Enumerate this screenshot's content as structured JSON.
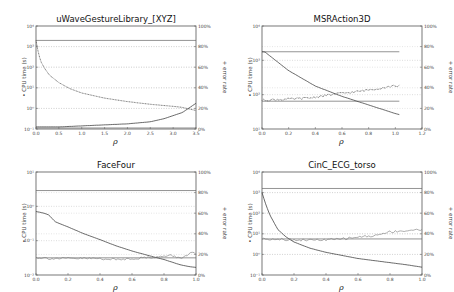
{
  "chart_data": [
    {
      "type": "line",
      "title": "uWaveGestureLibrary_[XYZ]",
      "xlabel": "ρ",
      "ylabel": "CPU time (s)",
      "ylabel_marker": "•",
      "y2label": "error rate",
      "y2label_marker": "+",
      "xlim": [
        0.0,
        3.5
      ],
      "xticks": [
        "0.0",
        "0.5",
        "1.0",
        "1.5",
        "2.0",
        "2.5",
        "3.0",
        "3.5"
      ],
      "ylim_log10": [
        -1,
        4
      ],
      "yticks": [
        "10⁴",
        "10³",
        "10²",
        "10¹",
        "10⁰",
        "10⁻¹"
      ],
      "y2lim": [
        0,
        100
      ],
      "y2ticks": [
        "100%",
        "80%",
        "60%",
        "40%",
        "20%",
        "0%"
      ],
      "grid": "horizontal-dotted",
      "reference_lines": [
        {
          "name": "baseline CPU time",
          "axis": "left",
          "log10_value": 3.3
        },
        {
          "name": "baseline error rate",
          "axis": "right",
          "value": 1
        }
      ],
      "series": [
        {
          "name": "CPU time (s)",
          "axis": "left",
          "style": "dotted",
          "x": [
            0.0,
            0.05,
            0.1,
            0.2,
            0.3,
            0.5,
            0.75,
            1.0,
            1.5,
            2.0,
            2.5,
            3.0,
            3.2,
            3.5
          ],
          "log10_y": [
            3.3,
            2.7,
            2.3,
            1.9,
            1.6,
            1.25,
            0.95,
            0.75,
            0.5,
            0.33,
            0.2,
            0.1,
            0.05,
            -0.1
          ]
        },
        {
          "name": "error rate",
          "axis": "right",
          "style": "solid",
          "x": [
            0.0,
            0.5,
            1.0,
            1.5,
            2.0,
            2.5,
            2.8,
            3.0,
            3.2,
            3.4,
            3.5
          ],
          "y": [
            2,
            2,
            3,
            4,
            5,
            7,
            10,
            13,
            16,
            22,
            25
          ]
        }
      ]
    },
    {
      "type": "line",
      "title": "MSRAction3D",
      "xlabel": "ρ",
      "ylabel": "CPU time (s)",
      "ylabel_marker": "•",
      "y2label": "error rate",
      "y2label_marker": "+",
      "xlim": [
        0.0,
        1.2
      ],
      "xticks": [
        "0.0",
        "0.2",
        "0.4",
        "0.6",
        "0.8",
        "1.0",
        "1.2"
      ],
      "ylim_log10": [
        1,
        4
      ],
      "yticks": [
        "10⁴",
        "10³",
        "10²",
        "10¹"
      ],
      "y2lim": [
        0,
        100
      ],
      "y2ticks": [
        "100%",
        "80%",
        "60%",
        "40%",
        "20%",
        "0%"
      ],
      "grid": "horizontal-dotted",
      "reference_lines": [
        {
          "name": "baseline CPU time",
          "axis": "left",
          "log10_value": 3.25,
          "x_end": 1.03
        },
        {
          "name": "baseline error rate",
          "axis": "right",
          "value": 27,
          "x_end": 1.03
        }
      ],
      "series": [
        {
          "name": "CPU time (s)",
          "axis": "left",
          "style": "solid",
          "x": [
            0.0,
            0.02,
            0.2,
            0.4,
            0.6,
            0.8,
            1.0,
            1.03
          ],
          "log10_y": [
            3.25,
            3.25,
            2.7,
            2.25,
            1.95,
            1.7,
            1.45,
            1.42
          ]
        },
        {
          "name": "error rate",
          "axis": "right",
          "style": "dotted",
          "x": [
            0.0,
            0.2,
            0.35,
            0.45,
            0.55,
            0.7,
            0.85,
            1.0,
            1.03
          ],
          "y": [
            28,
            29,
            30,
            32,
            34,
            36,
            39,
            42,
            42
          ]
        }
      ]
    },
    {
      "type": "line",
      "title": "FaceFour",
      "xlabel": "ρ",
      "ylabel": "CPU time (s)",
      "ylabel_marker": "•",
      "y2label": "error rate",
      "y2label_marker": "+",
      "xlim": [
        0.0,
        1.0
      ],
      "xticks": [
        "0.0",
        "0.2",
        "0.4",
        "0.6",
        "0.8",
        "1.0"
      ],
      "ylim_log10": [
        -2,
        1
      ],
      "yticks": [
        "10¹",
        "10⁰",
        "10⁻¹",
        "10⁻²"
      ],
      "y2lim": [
        0,
        100
      ],
      "y2ticks": [
        "100%",
        "80%",
        "60%",
        "40%",
        "20%",
        "0%"
      ],
      "grid": "horizontal-dotted",
      "reference_lines": [
        {
          "name": "baseline error rate",
          "axis": "right",
          "value": 82
        },
        {
          "name": "baseline CPU time",
          "axis": "left",
          "log10_value": -1.5
        }
      ],
      "series": [
        {
          "name": "CPU time (s)",
          "axis": "left",
          "style": "solid",
          "x": [
            0.0,
            0.05,
            0.08,
            0.12,
            0.2,
            0.3,
            0.4,
            0.5,
            0.6,
            0.7,
            0.8,
            0.9,
            0.95,
            1.0
          ],
          "log10_y": [
            -0.15,
            -0.2,
            -0.25,
            -0.45,
            -0.6,
            -0.8,
            -0.97,
            -1.15,
            -1.3,
            -1.43,
            -1.55,
            -1.7,
            -1.75,
            -1.78
          ]
        },
        {
          "name": "error rate",
          "axis": "right",
          "style": "noisy",
          "x": [
            0.0,
            0.1,
            0.2,
            0.3,
            0.4,
            0.5,
            0.6,
            0.7,
            0.8,
            0.85,
            0.9,
            0.95,
            0.97,
            1.0
          ],
          "y": [
            17,
            16,
            16,
            16,
            16,
            15,
            16,
            17,
            18,
            19,
            16,
            20,
            22,
            20
          ]
        }
      ]
    },
    {
      "type": "line",
      "title": "CinC_ECG_torso",
      "xlabel": "ρ",
      "ylabel": "CPU time (s)",
      "ylabel_marker": "•",
      "y2label": "error rate",
      "y2label_marker": "+",
      "xlim": [
        0.0,
        1.0
      ],
      "xticks": [
        "0.0",
        "0.2",
        "0.4",
        "0.6",
        "0.8",
        "1.0"
      ],
      "ylim_log10": [
        -1,
        4
      ],
      "yticks": [
        "10⁴",
        "10³",
        "10²",
        "10¹",
        "10⁰",
        "10⁻¹"
      ],
      "y2lim": [
        0,
        100
      ],
      "y2ticks": [
        "100%",
        "80%",
        "60%",
        "40%",
        "20%",
        "0%"
      ],
      "grid": "horizontal-dotted",
      "reference_lines": [
        {
          "name": "baseline CPU time",
          "axis": "left",
          "log10_value": 3.2
        },
        {
          "name": "baseline error rate",
          "axis": "right",
          "value": 35
        }
      ],
      "series": [
        {
          "name": "CPU time (s)",
          "axis": "left",
          "style": "solid",
          "x": [
            0.0,
            0.02,
            0.05,
            0.1,
            0.15,
            0.2,
            0.3,
            0.4,
            0.5,
            0.6,
            0.7,
            0.8,
            0.9,
            1.0
          ],
          "log10_y": [
            3.0,
            2.5,
            1.9,
            1.2,
            0.85,
            0.6,
            0.3,
            0.1,
            -0.05,
            -0.2,
            -0.3,
            -0.4,
            -0.5,
            -0.62
          ]
        },
        {
          "name": "error rate",
          "axis": "right",
          "style": "noisy",
          "x": [
            0.0,
            0.1,
            0.2,
            0.3,
            0.4,
            0.5,
            0.6,
            0.7,
            0.8,
            0.9,
            1.0
          ],
          "y": [
            35,
            35,
            34,
            34,
            34,
            35,
            37,
            38,
            42,
            43,
            44
          ]
        }
      ]
    }
  ]
}
